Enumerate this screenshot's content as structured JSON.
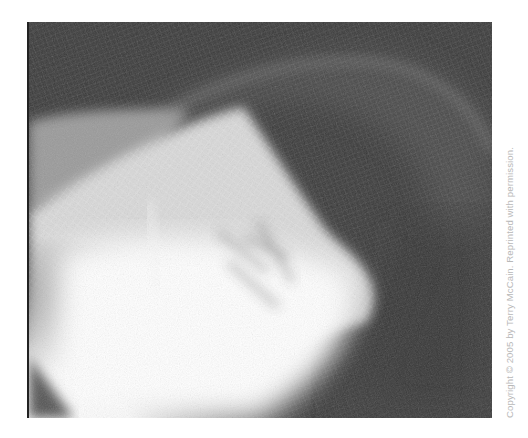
{
  "figure": {
    "alt": "Black-and-white photograph of a translucent white netted fabric form, brightly lit at lower left and fading into dark gray at upper right",
    "colors": {
      "background_dark": "#3b3b3b",
      "highlight": "#f6f6f6",
      "mid_gray": "#8a8a8a",
      "page": "#ffffff",
      "caption_text": "#b8b8b8"
    }
  },
  "caption": {
    "text": "Copyright © 2005 by Terry McCain. Reprinted with permission.",
    "orientation": "vertical-bottom-to-top"
  }
}
